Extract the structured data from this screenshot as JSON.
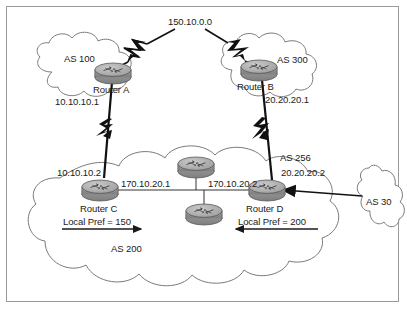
{
  "figure": {
    "type": "network-topology-diagram",
    "title_text": "",
    "frame_color": "#9a9a9a",
    "background": "#ffffff",
    "router_fill": "#a8a8a8",
    "link_color": "#000000",
    "cloud_outline": "#7a7a7a"
  },
  "labels": {
    "transit_prefix": "150.10.0.0",
    "as100": "AS 100",
    "as300": "AS 300",
    "as200": "AS 200",
    "as256": "AS 256",
    "as30": "AS 30",
    "router_a": "Router A",
    "router_b": "Router B",
    "router_c": "Router C",
    "router_d": "Router D",
    "ip_a": "10.10.10.1",
    "ip_b": "20.20.20.1",
    "ip_c_ext": "10.10.10.2",
    "ip_c_int": "170.10.20.1",
    "ip_d_int": "170.10.20.2",
    "ip_d_ext": "20.20.20.2",
    "local_pref_c": "Local Pref = 150",
    "local_pref_d": "Local Pref = 200"
  },
  "nodes": [
    {
      "id": "router-a",
      "label": "Router A",
      "as": "AS 100",
      "ip": "10.10.10.1",
      "x": 113,
      "y": 73
    },
    {
      "id": "router-b",
      "label": "Router B",
      "as": "AS 300",
      "ip": "20.20.20.1",
      "x": 258,
      "y": 70
    },
    {
      "id": "router-c",
      "label": "Router C",
      "as": "AS 200",
      "ip": "10.10.10.2",
      "x": 101,
      "y": 190
    },
    {
      "id": "router-d",
      "label": "Router D",
      "as": "AS 200",
      "ip": "20.20.20.2",
      "x": 267,
      "y": 190
    },
    {
      "id": "router-core-top",
      "label": "",
      "as": "AS 200",
      "ip": "",
      "x": 196,
      "y": 167
    },
    {
      "id": "router-core-bottom",
      "label": "",
      "as": "AS 200",
      "ip": "",
      "x": 204,
      "y": 214
    }
  ],
  "links": [
    {
      "from": "transit",
      "to": "router-a",
      "style": "lightning"
    },
    {
      "from": "transit",
      "to": "router-b",
      "style": "lightning"
    },
    {
      "from": "router-a",
      "to": "router-c",
      "style": "lightning"
    },
    {
      "from": "router-b",
      "to": "router-d",
      "style": "lightning"
    },
    {
      "from": "router-c",
      "to": "router-d",
      "style": "bus"
    },
    {
      "from": "as30",
      "to": "router-d",
      "style": "arrow"
    }
  ],
  "annotations": [
    {
      "text": "Local Pref = 150",
      "direction": "right"
    },
    {
      "text": "Local Pref = 200",
      "direction": "left"
    }
  ]
}
